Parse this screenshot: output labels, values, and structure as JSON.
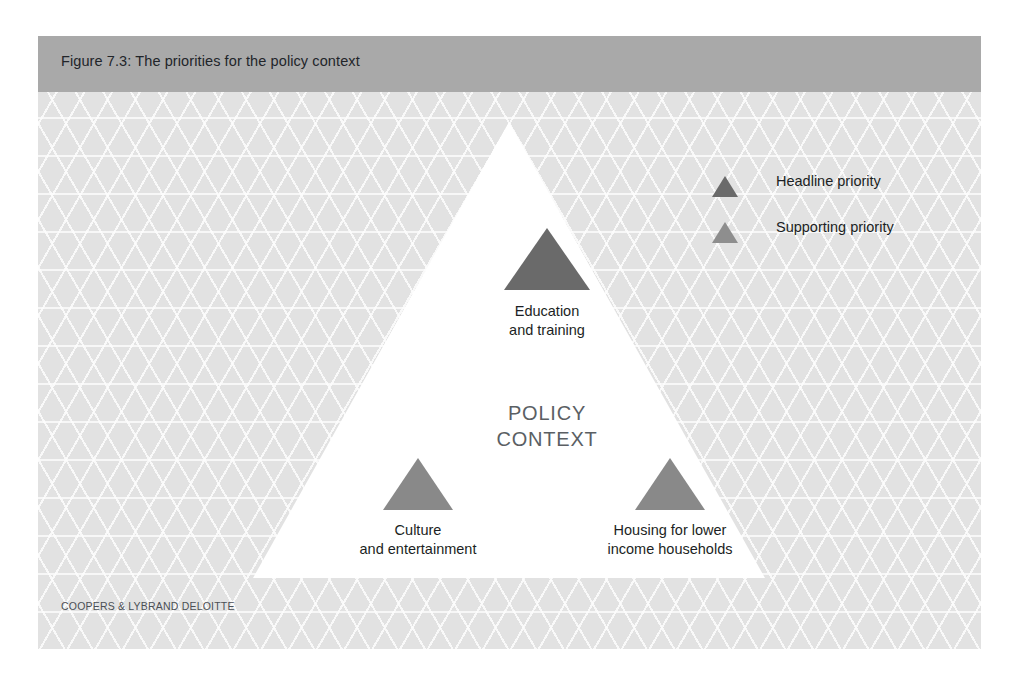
{
  "figure": {
    "title": "Figure 7.3: The priorities for the policy context",
    "center_label_line1": "POLICY",
    "center_label_line2": "CONTEXT",
    "footer_credit": "COOPERS & LYBRAND DELOITTE"
  },
  "legend": {
    "items": [
      {
        "label": "Headline priority",
        "swatch_icon": "triangle-icon",
        "color": "#6a6a6a"
      },
      {
        "label": "Supporting priority",
        "swatch_icon": "triangle-icon",
        "color": "#8e8e8e"
      }
    ]
  },
  "nodes": [
    {
      "id": "education",
      "label_line1": "Education",
      "label_line2": "and training",
      "priority": "Headline priority",
      "color": "#6a6a6a"
    },
    {
      "id": "culture",
      "label_line1": "Culture",
      "label_line2": "and entertainment",
      "priority": "Supporting priority",
      "color": "#898989"
    },
    {
      "id": "housing",
      "label_line1": "Housing for lower",
      "label_line2": "income households",
      "priority": "Supporting priority",
      "color": "#898989"
    }
  ],
  "colors": {
    "header_band": "#a9a9a9",
    "panel_background": "#e3e3e3",
    "triangle_fill": "#ffffff",
    "headline_priority": "#6a6a6a",
    "supporting_priority": "#898989"
  }
}
